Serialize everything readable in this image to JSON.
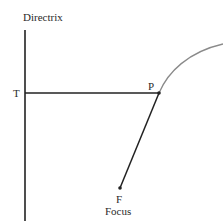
{
  "diagram": {
    "type": "parabola-focus-directrix",
    "labels": {
      "directrix": "Directrix",
      "t_point": "T",
      "p_point": "P",
      "f_point": "F",
      "focus": "Focus"
    },
    "colors": {
      "lines": "#222222",
      "curve": "#8a8a8a",
      "background": "#ffffff"
    }
  }
}
